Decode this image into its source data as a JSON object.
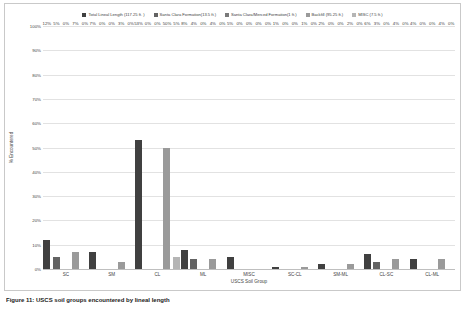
{
  "chart_data": {
    "type": "bar",
    "title": "",
    "xlabel": "USCS Soil Group",
    "ylabel": "% Encountered",
    "ylim": [
      0,
      100
    ],
    "y_ticks": [
      "0%",
      "10%",
      "20%",
      "30%",
      "40%",
      "50%",
      "60%",
      "70%",
      "80%",
      "90%",
      "100%"
    ],
    "grid": true,
    "legend_position": "top",
    "categories": [
      "SC",
      "SM",
      "CL",
      "ML",
      "MISC",
      "SC-CL",
      "SM-ML",
      "CL-SC",
      "CL-ML"
    ],
    "series": [
      {
        "name": "Total Lineal Length (117.25 ft. )",
        "color": "#404040",
        "values": [
          12,
          7,
          53,
          8,
          5,
          1,
          2,
          6,
          4
        ],
        "labels": [
          "12%",
          "7%",
          "53%",
          "8%",
          "5%",
          "1%",
          "2%",
          "6%",
          "4%"
        ]
      },
      {
        "name": "Santa Clara Formation(13.5 ft.)",
        "color": "#636363",
        "values": [
          5,
          0,
          0,
          4,
          0,
          0,
          0,
          3,
          0
        ],
        "labels": [
          "5%",
          "0%",
          "0%",
          "4%",
          "0%",
          "0%",
          "0%",
          "3%",
          "0%"
        ]
      },
      {
        "name": "Santa Clara/Merced Formation(1 ft.)",
        "color": "#7a7a7a",
        "values": [
          0,
          0,
          0,
          0,
          0,
          0,
          0,
          0,
          0
        ],
        "labels": [
          "0%",
          "0%",
          "0%",
          "0%",
          "0%",
          "0%",
          "0%",
          "0%",
          "0%"
        ]
      },
      {
        "name": "Backfill (95.25 ft.)",
        "color": "#9a9a9a",
        "values": [
          7,
          3,
          50,
          4,
          0,
          1,
          2,
          4,
          4
        ],
        "labels": [
          "7%",
          "3%",
          "50%",
          "4%",
          "0%",
          "1%",
          "2%",
          "4%",
          "4%"
        ]
      },
      {
        "name": "MISC (7.5 ft.)",
        "color": "#b5b5b5",
        "values": [
          0,
          0,
          5,
          0,
          0,
          0,
          0,
          0,
          0
        ],
        "labels": [
          "0%",
          "0%",
          "5%",
          "0%",
          "0%",
          "0%",
          "0%",
          "0%",
          "0%"
        ]
      }
    ]
  },
  "caption": "Figure 11:  USCS soil groups encountered by lineal length"
}
